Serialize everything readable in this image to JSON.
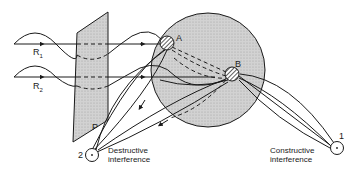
{
  "figure": {
    "type": "interference-diagram",
    "colors": {
      "ink": "#1a1a1a",
      "fill": "#cfcfcf",
      "background": "#ffffff"
    },
    "labels": {
      "ray1": "R",
      "ray1_sub": "1",
      "ray2": "R",
      "ray2_sub": "2",
      "plate": "P",
      "scatterer_a": "A",
      "scatterer_b": "B",
      "detector1": "1",
      "detector2": "2",
      "destructive_line1": "Destructive",
      "destructive_line2": "interference",
      "constructive_line1": "Constructive",
      "constructive_line2": "interference"
    }
  }
}
